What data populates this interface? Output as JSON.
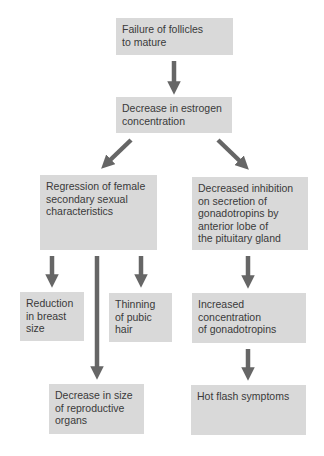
{
  "diagram": {
    "nodes": {
      "failure": "Failure of follicles\nto mature",
      "estrogen": "Decrease in estrogen\nconcentration",
      "regression": "Regression of female\nsecondary sexual\ncharacteristics",
      "inhibition": "Decreased inhibition\non secretion of\ngonadotropins by\nanterior lobe of\nthe pituitary gland",
      "breast": "Reduction\nin breast\nsize",
      "pubic": "Thinning\nof pubic\nhair",
      "organs": "Decrease in size\nof reproductive\norgans",
      "gonadotropins": "Increased\nconcentration\nof gonadotropins",
      "hotflash": "Hot flash symptoms"
    },
    "edges": [
      [
        "failure",
        "estrogen"
      ],
      [
        "estrogen",
        "regression"
      ],
      [
        "estrogen",
        "inhibition"
      ],
      [
        "regression",
        "breast"
      ],
      [
        "regression",
        "organs"
      ],
      [
        "regression",
        "pubic"
      ],
      [
        "inhibition",
        "gonadotropins"
      ],
      [
        "gonadotropins",
        "hotflash"
      ]
    ],
    "colors": {
      "box": "#d9d9d9",
      "arrow": "#666666",
      "text": "#3a3a3a"
    }
  }
}
